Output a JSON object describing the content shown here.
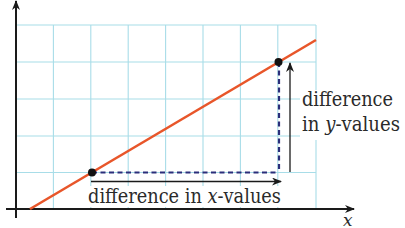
{
  "diagram": {
    "type": "slope-illustration",
    "grid": {
      "origin_px": [
        16,
        209
      ],
      "cell_px": 37.4,
      "columns": 8,
      "rows": 5,
      "color": "#a8dde8"
    },
    "axes": {
      "x_label": "x",
      "y_label": "y",
      "color": "#1a1a1a"
    },
    "line": {
      "color": "#e8562a",
      "start_px": [
        30,
        209
      ],
      "end_px": [
        316,
        40
      ]
    },
    "points": [
      {
        "name": "point-1",
        "px": [
          92,
          172
        ],
        "grid": [
          2,
          1
        ]
      },
      {
        "name": "point-2",
        "px": [
          278,
          62
        ],
        "grid": [
          7,
          4
        ]
      }
    ],
    "dashed_color": "#2b2e7a",
    "annotations": {
      "x_difference": "difference in x-values",
      "x_difference_parts": [
        "difference in ",
        "x",
        "-values"
      ],
      "y_difference_line1": "difference",
      "y_difference_line2_parts": [
        "in ",
        "y",
        "-values"
      ]
    }
  }
}
